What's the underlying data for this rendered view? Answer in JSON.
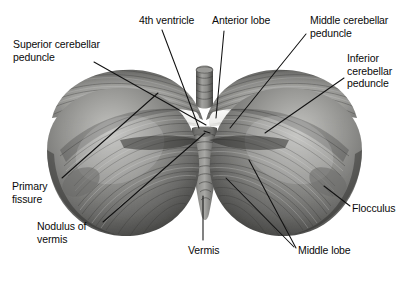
{
  "figure": {
    "background_color": "#ffffff",
    "ink_color": "#111111"
  },
  "labels": [
    {
      "id": "superior-cerebellar-peduncle",
      "lines": [
        "Superior cerebellar",
        "peduncle"
      ],
      "x": 13,
      "y": 38,
      "align": "left"
    },
    {
      "id": "fourth-ventricle",
      "lines": [
        "4th ventricle"
      ],
      "x": 139,
      "y": 14,
      "align": "left"
    },
    {
      "id": "anterior-lobe",
      "lines": [
        "Anterior lobe"
      ],
      "x": 212,
      "y": 14,
      "align": "left"
    },
    {
      "id": "middle-cerebellar-peduncle",
      "lines": [
        "Middle cerebellar",
        "peduncle"
      ],
      "x": 310,
      "y": 14,
      "align": "left"
    },
    {
      "id": "inferior-cerebellar-peduncle",
      "lines": [
        "Inferior",
        "cerebellar",
        "peduncle"
      ],
      "x": 347,
      "y": 52,
      "align": "left"
    },
    {
      "id": "primary-fissure",
      "lines": [
        "Primary",
        "fissure"
      ],
      "x": 12,
      "y": 180,
      "align": "left"
    },
    {
      "id": "nodulus-of-vermis",
      "lines": [
        "Nodulus of",
        "vermis"
      ],
      "x": 37,
      "y": 220,
      "align": "left"
    },
    {
      "id": "vermis",
      "lines": [
        "Vermis"
      ],
      "x": 188,
      "y": 244,
      "align": "left"
    },
    {
      "id": "middle-lobe",
      "lines": [
        "Middle lobe"
      ],
      "x": 298,
      "y": 244,
      "align": "left"
    },
    {
      "id": "flocculus",
      "lines": [
        "Flocculus"
      ],
      "x": 352,
      "y": 202,
      "align": "left"
    }
  ],
  "leader_lines": [
    {
      "id": "leader-superior-cerebellar-peduncle",
      "points": "94,62 206,125"
    },
    {
      "id": "leader-fourth-ventricle",
      "points": "162,30 199,128"
    },
    {
      "id": "leader-fourth-ventricle-right",
      "points": "204,131 210,133"
    },
    {
      "id": "leader-anterior-lobe",
      "points": "224,31 216,118"
    },
    {
      "id": "leader-middle-cerebellar-peduncle",
      "points": "306,34 230,128"
    },
    {
      "id": "leader-inferior-cerebellar-peduncle",
      "points": "344,78 265,133"
    },
    {
      "id": "leader-primary-fissure",
      "points": "62,178 158,93"
    },
    {
      "id": "leader-nodulus-of-vermis",
      "points": "103,222 205,133"
    },
    {
      "id": "leader-vermis",
      "points": "203,240 203,196"
    },
    {
      "id": "leader-middle-lobe-a",
      "points": "294,247 226,178"
    },
    {
      "id": "leader-middle-lobe-b",
      "points": "296,248 249,160"
    },
    {
      "id": "leader-flocculus",
      "points": "350,206 324,186"
    }
  ],
  "art": {
    "description": "Posterior view of the human cerebellum showing two hemispheres with folia, central vermis, superior medullary velum and cut peduncles",
    "tones": {
      "highlight": "#f2f2f0",
      "light": "#c9c9c7",
      "mid": "#8d8d8b",
      "dark": "#555553",
      "deep": "#2f2f2e"
    }
  }
}
